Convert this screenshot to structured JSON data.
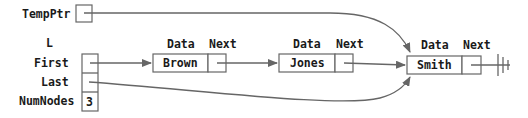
{
  "labels": {
    "tempptr": "TempPtr",
    "list": "L",
    "first": "First",
    "last": "Last",
    "numnodes": "NumNodes",
    "numnodes_value": "3"
  },
  "node_headers": {
    "data": "Data",
    "next": "Next"
  },
  "nodes": [
    {
      "data": "Brown"
    },
    {
      "data": "Jones"
    },
    {
      "data": "Smith"
    }
  ],
  "colors": {
    "line": "#666666",
    "text": "#1a1a1a"
  }
}
